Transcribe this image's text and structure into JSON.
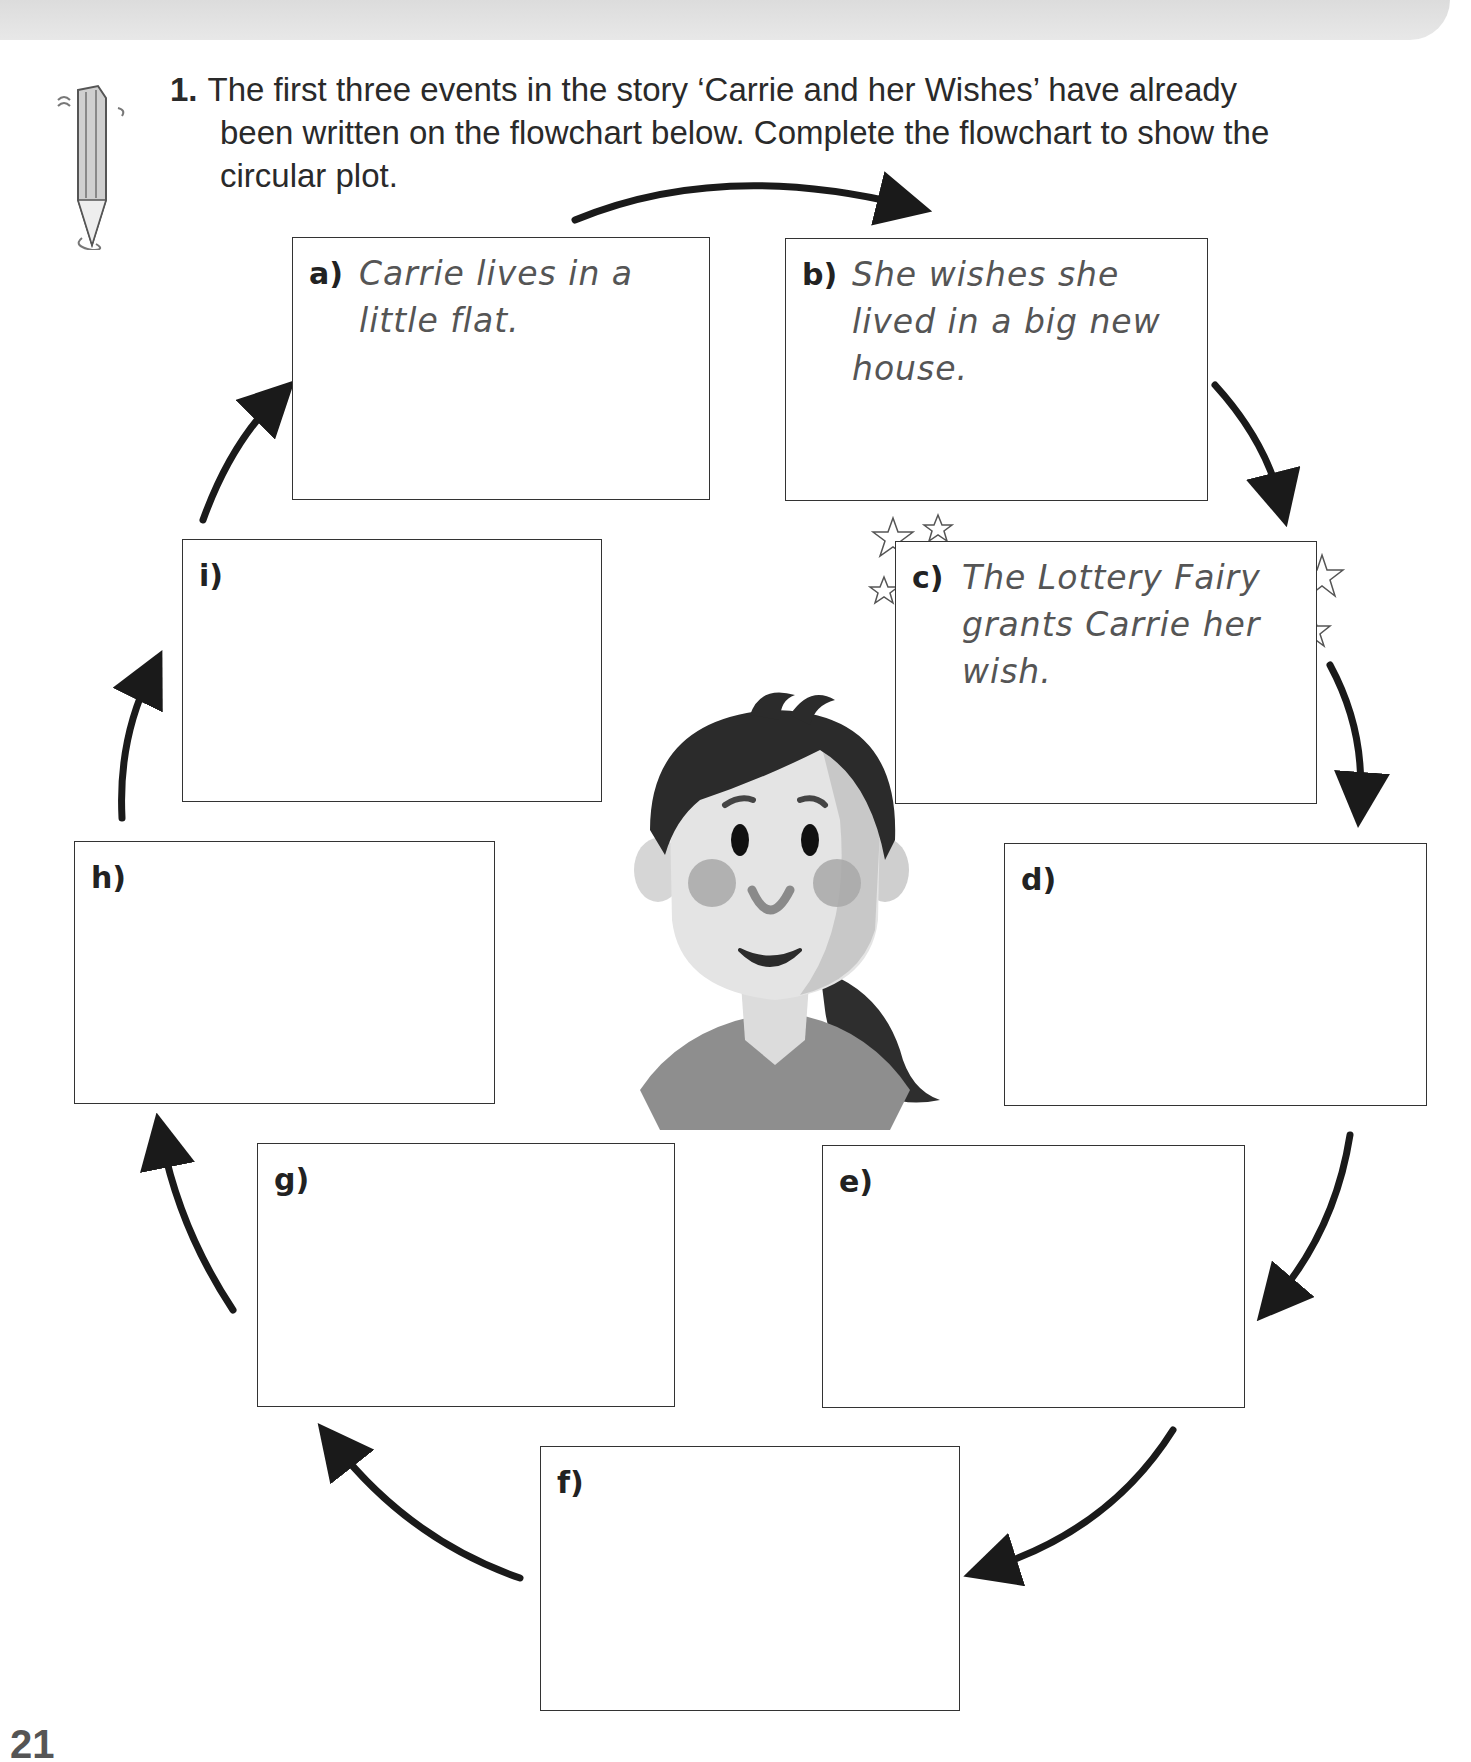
{
  "question": {
    "number": "1.",
    "line1": "The first three events in the story ‘Carrie and her Wishes’ have already",
    "line2": "been written on the flowchart below. Complete the flowchart to show the",
    "line3": "circular plot."
  },
  "flowchart": {
    "boxes": [
      {
        "label": "a)",
        "text": "Carrie lives in a little flat."
      },
      {
        "label": "b)",
        "text": "She wishes she lived in a big new house."
      },
      {
        "label": "c)",
        "text": "The Lottery Fairy grants Carrie her wish."
      },
      {
        "label": "d)",
        "text": ""
      },
      {
        "label": "e)",
        "text": ""
      },
      {
        "label": "f)",
        "text": ""
      },
      {
        "label": "g)",
        "text": ""
      },
      {
        "label": "h)",
        "text": ""
      },
      {
        "label": "i)",
        "text": ""
      }
    ]
  },
  "page_number": "21"
}
